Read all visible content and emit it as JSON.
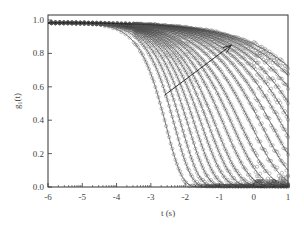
{
  "chart_data": {
    "type": "line",
    "title": "",
    "xlabel": "t (s)",
    "ylabel": "g1(t)",
    "ylabel_main": "g",
    "ylabel_sub": "1",
    "ylabel_tail": "(t)",
    "xscale": "log10",
    "xlim": [
      -6,
      1
    ],
    "ylim": [
      0.0,
      1.0
    ],
    "xticks": [
      -6,
      -5,
      -4,
      -3,
      -2,
      -1,
      0,
      1
    ],
    "xtick_labels": [
      "-6",
      "-5",
      "-4",
      "-3",
      "-2",
      "-1",
      "0",
      "1"
    ],
    "yticks": [
      0.0,
      0.2,
      0.4,
      0.6,
      0.8,
      1.0
    ],
    "ytick_labels": [
      "0.0",
      "0.2",
      "0.4",
      "0.6",
      "0.8",
      "1.0"
    ],
    "grid": false,
    "legend": null,
    "marker": "open-circle",
    "fit_lines": true,
    "annotations": [
      {
        "type": "arrow",
        "from": [
          -2.6,
          0.55
        ],
        "to": [
          -0.65,
          0.85
        ],
        "meaning": "trend of increasing relaxation time"
      }
    ],
    "series_description": "Family of decaying intensity correlation curves; each starts near g1=1.0 and decays with progressively slower relaxation. Fastest curves reach ~0 near log t = -1.5; slowest end near 0.62 at log t = 1.",
    "series": [
      {
        "name": "c1",
        "tau_log": -2.55,
        "beta": 0.95,
        "plateau": 1.0
      },
      {
        "name": "c2",
        "tau_log": -2.3,
        "beta": 0.9,
        "plateau": 1.0
      },
      {
        "name": "c3",
        "tau_log": -2.1,
        "beta": 0.85,
        "plateau": 1.0
      },
      {
        "name": "c4",
        "tau_log": -1.9,
        "beta": 0.8,
        "plateau": 1.0
      },
      {
        "name": "c5",
        "tau_log": -1.7,
        "beta": 0.75,
        "plateau": 1.0
      },
      {
        "name": "c6",
        "tau_log": -1.5,
        "beta": 0.7,
        "plateau": 1.0
      },
      {
        "name": "c7",
        "tau_log": -1.3,
        "beta": 0.66,
        "plateau": 1.0
      },
      {
        "name": "c8",
        "tau_log": -1.1,
        "beta": 0.62,
        "plateau": 1.0
      },
      {
        "name": "c9",
        "tau_log": -0.85,
        "beta": 0.58,
        "plateau": 1.0
      },
      {
        "name": "c10",
        "tau_log": -0.6,
        "beta": 0.55,
        "plateau": 1.0
      },
      {
        "name": "c11",
        "tau_log": -0.35,
        "beta": 0.52,
        "plateau": 1.0
      },
      {
        "name": "c12",
        "tau_log": -0.05,
        "beta": 0.5,
        "plateau": 1.0
      },
      {
        "name": "c13",
        "tau_log": 0.25,
        "beta": 0.48,
        "plateau": 1.0
      },
      {
        "name": "c14",
        "tau_log": 0.55,
        "beta": 0.46,
        "plateau": 1.0
      },
      {
        "name": "c15",
        "tau_log": 0.85,
        "beta": 0.44,
        "plateau": 1.0
      },
      {
        "name": "c16",
        "tau_log": 1.15,
        "beta": 0.42,
        "plateau": 1.0
      },
      {
        "name": "c17",
        "tau_log": 1.45,
        "beta": 0.4,
        "plateau": 1.0
      },
      {
        "name": "c18",
        "tau_log": 1.8,
        "beta": 0.38,
        "plateau": 1.0
      },
      {
        "name": "c19",
        "tau_log": 2.15,
        "beta": 0.36,
        "plateau": 1.0
      },
      {
        "name": "c20",
        "tau_log": 2.5,
        "beta": 0.34,
        "plateau": 1.0
      }
    ],
    "endpoint_values_at_log_t_1": [
      0.0,
      0.0,
      0.0,
      0.02,
      0.03,
      0.05,
      0.1,
      0.15,
      0.22,
      0.28,
      0.33,
      0.38,
      0.42,
      0.46,
      0.5,
      0.53,
      0.56,
      0.58,
      0.6,
      0.62
    ]
  },
  "colors": {
    "axis": "#333333",
    "markers": "#555555",
    "lines": "#222222",
    "background": "#ffffff"
  },
  "layout": {
    "plot_left": 48,
    "plot_right": 288,
    "plot_top": 15,
    "plot_bottom": 187
  }
}
